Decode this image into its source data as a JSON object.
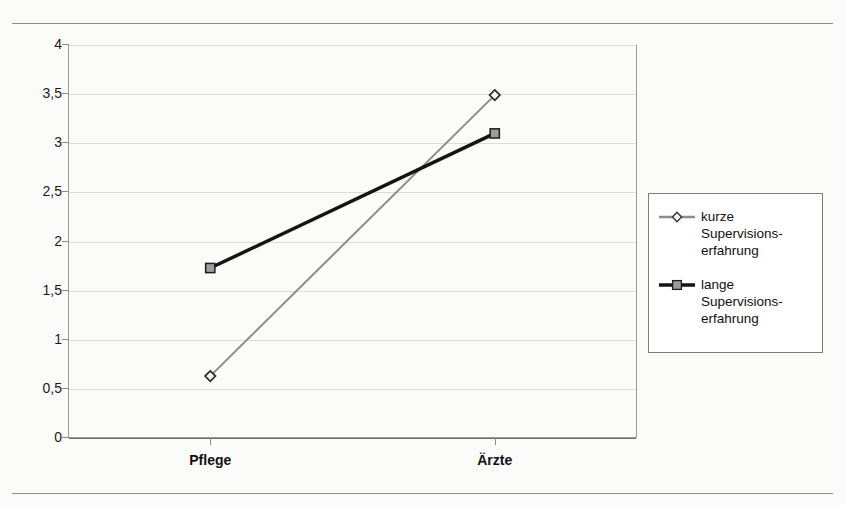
{
  "figure": {
    "background_color": "#fbfbfa",
    "plot_border_color": "#9a9a9a",
    "gridline_color": "#dcdcdc"
  },
  "chart_data": {
    "type": "line",
    "title": "",
    "xlabel": "",
    "ylabel": "",
    "categories": [
      "Pflege",
      "Ärzte"
    ],
    "ylim": [
      0,
      4
    ],
    "yticks": [
      0,
      0.5,
      1,
      1.5,
      2,
      2.5,
      3,
      3.5,
      4
    ],
    "ytick_labels": [
      "0",
      "0,5",
      "1",
      "1,5",
      "2",
      "2,5",
      "3",
      "3,5",
      "4"
    ],
    "grid": true,
    "legend_position": "right",
    "series": [
      {
        "name": "kurze Supervisions-\nerfahrung",
        "legend_label": "kurze Supervisions-\nerfahrung",
        "values": [
          0.63,
          3.49
        ],
        "color": "#8c8c8c",
        "marker": "diamond",
        "line_width": 2
      },
      {
        "name": "lange Supervisions-\nerfahrung",
        "legend_label": "lange Supervisions-\nerfahrung",
        "values": [
          1.73,
          3.1
        ],
        "color": "#141414",
        "marker": "square",
        "line_width": 3.5
      }
    ]
  },
  "axis": {
    "y_tick_labels": [
      "4",
      "3,5",
      "3",
      "2,5",
      "2",
      "1,5",
      "1",
      "0,5",
      "0"
    ],
    "x_tick_labels": [
      "Pflege",
      "Ärzte"
    ]
  }
}
